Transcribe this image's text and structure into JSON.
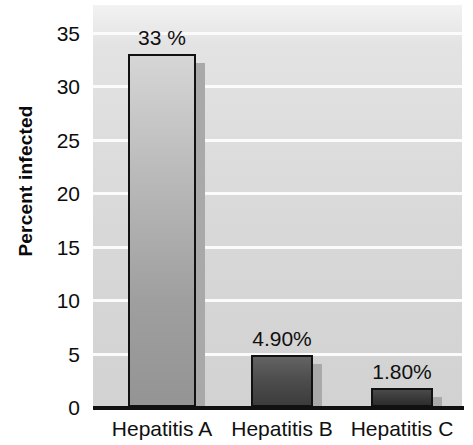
{
  "chart_data": {
    "type": "bar",
    "title": "",
    "subtitle": "",
    "categories": [
      "Hepatitis A",
      "Hepatitis B",
      "Hepatitis C"
    ],
    "values": [
      33,
      4.9,
      1.8
    ],
    "data_labels": [
      "33 %",
      "4.90%",
      "1.80%"
    ],
    "xlabel": "",
    "ylabel": "Percent infected",
    "ylim": [
      0,
      35
    ],
    "yticks": [
      0,
      5,
      10,
      15,
      20,
      25,
      30,
      35
    ],
    "ytick_labels": [
      "0",
      "5",
      "10",
      "15",
      "20",
      "25",
      "30",
      "35"
    ],
    "grid": "horizontal",
    "legend": "none",
    "plot_background": "#d8d8d8",
    "bar_colors": [
      "#b0b0b0",
      "#4a4a4a",
      "#3a3a3a"
    ],
    "bar_border_color": "#111111",
    "shadow_color": "#a9a9a9",
    "gridline_color": "#fbfbfb",
    "axis_color": "#101010"
  }
}
